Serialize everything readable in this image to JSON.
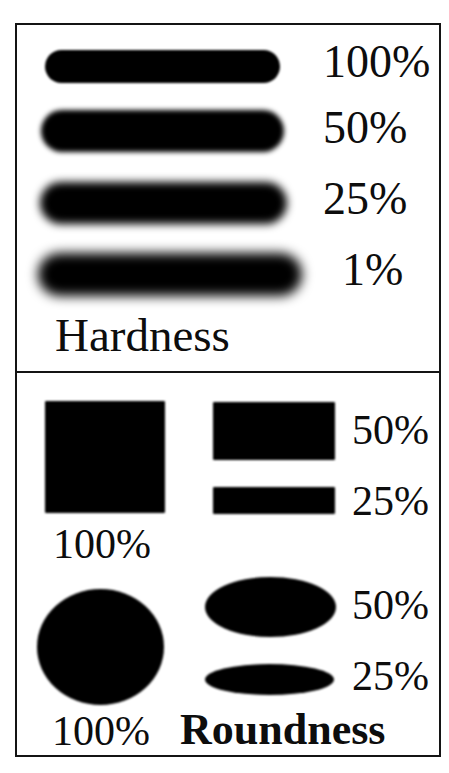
{
  "figure": {
    "ink_color": "#000000",
    "background_color": "#ffffff",
    "border_color": "#141414"
  },
  "hardness_panel": {
    "caption": "Hardness",
    "rows": [
      {
        "label": "100%",
        "value": 100,
        "blur_px": 1.1
      },
      {
        "label": "50%",
        "value": 50,
        "blur_px": 2.6
      },
      {
        "label": "25%",
        "value": 25,
        "blur_px": 4.2
      },
      {
        "label": "1%",
        "value": 1,
        "blur_px": 6.0
      }
    ]
  },
  "roundness_panel": {
    "caption": "Roundness",
    "square_label": "100%",
    "circle_label": "100%",
    "rect_labels": [
      {
        "label": "50%",
        "value": 50
      },
      {
        "label": "25%",
        "value": 25
      }
    ],
    "ellipse_labels": [
      {
        "label": "50%",
        "value": 50
      },
      {
        "label": "25%",
        "value": 25
      }
    ]
  }
}
